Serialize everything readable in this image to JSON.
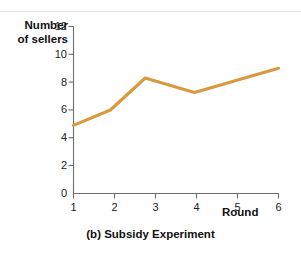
{
  "figure": {
    "caption": "(b) Subsidy Experiment",
    "line_color": "#d89a3c",
    "axis_color": "#6d6d6d"
  },
  "axes": {
    "ylabel_line1": "Number",
    "ylabel_line2": "of sellers",
    "xlabel": "Round",
    "yticks": [
      "12",
      "10",
      "8",
      "6",
      "4",
      "2",
      "0"
    ],
    "xticks": [
      "1",
      "2",
      "3",
      "4",
      "5",
      "6"
    ]
  },
  "chart_data": {
    "type": "line",
    "title": "(b) Subsidy Experiment",
    "xlabel": "Round",
    "ylabel": "Number of sellers",
    "xlim": [
      1,
      6
    ],
    "ylim": [
      0,
      12
    ],
    "grid": false,
    "legend": "none",
    "x": [
      1,
      1.9,
      2.75,
      3.95,
      6
    ],
    "values": [
      4.9,
      6.0,
      8.3,
      7.25,
      9.0
    ],
    "series": [
      {
        "name": "Number of sellers",
        "color": "#d89a3c",
        "points": [
          {
            "x": 1,
            "y": 4.9
          },
          {
            "x": 1.9,
            "y": 6.0
          },
          {
            "x": 2.75,
            "y": 8.3
          },
          {
            "x": 3.95,
            "y": 7.25
          },
          {
            "x": 6,
            "y": 9.0
          }
        ]
      }
    ],
    "ytick_values": [
      0,
      2,
      4,
      6,
      8,
      10,
      12
    ],
    "xtick_values": [
      1,
      2,
      3,
      4,
      5,
      6
    ]
  }
}
